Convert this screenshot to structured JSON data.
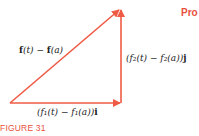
{
  "diagram": {
    "colors": {
      "arrow": "#EF5A45",
      "text": "#222222",
      "caption": "#E8503C"
    },
    "hypotenuse_label": {
      "f1": "f",
      "p1": "(t) − ",
      "f2": "f",
      "p2": "(a)"
    },
    "vertical_label": {
      "text": "(f₂(t) − f₂(a))",
      "unit": "j"
    },
    "horizontal_label": {
      "text": "(f₁(t) − f₁(a))",
      "unit": "i"
    },
    "caption": "FIGURE 31",
    "side_heading": "Pro"
  }
}
